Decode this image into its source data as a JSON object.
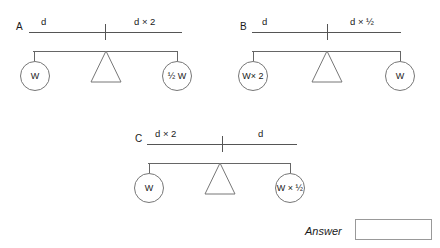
{
  "page": {
    "background_color": "#ffffff",
    "line_color": "#555555",
    "width": 440,
    "height": 248
  },
  "panels": [
    {
      "letter": "A",
      "ruler": {
        "left_label": "d",
        "right_label": "d × 2"
      },
      "balance": {
        "left_pan_label": "W",
        "right_pan_label": "½ W"
      }
    },
    {
      "letter": "B",
      "ruler": {
        "left_label": "d",
        "right_label": "d × ½"
      },
      "balance": {
        "left_pan_label": "W× 2",
        "right_pan_label": "W"
      }
    },
    {
      "letter": "C",
      "ruler": {
        "left_label": "d × 2",
        "right_label": "d"
      },
      "balance": {
        "left_pan_label": "W",
        "right_pan_label": "W × ½"
      }
    }
  ],
  "answer": {
    "label": "Answer",
    "value": "",
    "placeholder": ""
  }
}
